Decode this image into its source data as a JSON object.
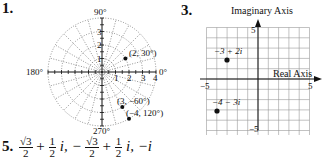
{
  "problems": [
    {
      "number": "1."
    },
    {
      "number": "3."
    },
    {
      "number": "5."
    }
  ],
  "chart_data": [
    {
      "type": "scatter",
      "subtype": "polar",
      "title": "",
      "angle_labels": [
        "90°",
        "0°",
        "180°",
        "270°"
      ],
      "radial_ticks": [
        "1",
        "2",
        "3",
        "4"
      ],
      "rmax": 4,
      "grid": true,
      "points": [
        {
          "label": "(2, 30°)",
          "r": 2,
          "theta_deg": 30
        },
        {
          "label": "(3, −60°)",
          "r": 3,
          "theta_deg": -60
        },
        {
          "label": "(−4, 120°)",
          "r": -4,
          "theta_deg": 120
        }
      ]
    },
    {
      "type": "scatter",
      "subtype": "complex-plane",
      "xlabel": "Real Axis",
      "ylabel": "Imaginary Axis",
      "xlim": [
        -5,
        5
      ],
      "ylim": [
        -5,
        5
      ],
      "x_tick_labels": [
        "−5",
        "5"
      ],
      "y_tick_labels": [
        "5",
        "−5"
      ],
      "grid": true,
      "points": [
        {
          "label": "−3 + 2i",
          "x": -3,
          "y": 2
        },
        {
          "label": "−4 − 3i",
          "x": -4,
          "y": -3
        }
      ]
    }
  ],
  "answer5": {
    "term1_num": "√3",
    "term1_den": "2",
    "plus1": "+",
    "half_num": "1",
    "half_den": "2",
    "i1": "i, −",
    "term2_num": "√3",
    "term2_den": "2",
    "plus2": "+",
    "half2_num": "1",
    "half2_den": "2",
    "tail": "i, −i"
  }
}
